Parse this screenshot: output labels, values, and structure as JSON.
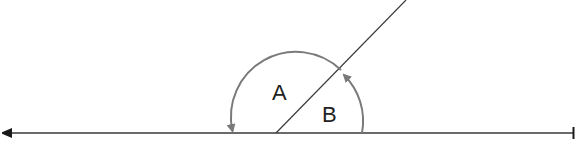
{
  "diagram": {
    "labels": {
      "angle_a": "A",
      "angle_b": "B"
    },
    "colors": {
      "line": "#3a3a3a",
      "arc": "#7a7a7a",
      "text": "#222222"
    },
    "angle_b_degrees": 45,
    "angle_a_degrees": 135
  }
}
